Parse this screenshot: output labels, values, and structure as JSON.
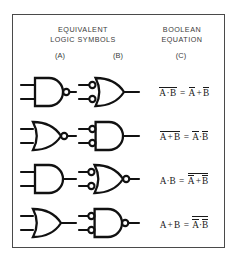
{
  "figure": {
    "border_color": "#4a4a4a",
    "background": "#ffffff",
    "ink_color": "#1a1a1a"
  },
  "header": {
    "left_title": "EQUIVALENT\nLOGIC SYMBOLS",
    "right_title": "BOOLEAN\nEQUATION",
    "columns": [
      {
        "key": "a",
        "label": "(A)"
      },
      {
        "key": "b",
        "label": "(B)"
      },
      {
        "key": "c",
        "label": "(C)"
      }
    ]
  },
  "rows": [
    {
      "index": 1,
      "symbol_a": {
        "shape": "and",
        "name": "nand-gate",
        "input_bubbles": false,
        "output_bubble": true
      },
      "symbol_b": {
        "shape": "or",
        "name": "negative-input-or-gate",
        "input_bubbles": true,
        "output_bubble": false
      },
      "equation": {
        "lhs": {
          "overbar": "full",
          "vars": [
            "A",
            "B"
          ],
          "operator": "·",
          "display": "A·B"
        },
        "rhs": {
          "overbar": "each",
          "vars": [
            "A",
            "B"
          ],
          "operator": "+",
          "display": "A + B"
        },
        "plain": "A·B (bar) = A(bar) + B(bar)"
      }
    },
    {
      "index": 2,
      "symbol_a": {
        "shape": "or",
        "name": "nor-gate",
        "input_bubbles": false,
        "output_bubble": true
      },
      "symbol_b": {
        "shape": "and",
        "name": "negative-input-and-gate",
        "input_bubbles": true,
        "output_bubble": false
      },
      "equation": {
        "lhs": {
          "overbar": "full",
          "vars": [
            "A",
            "B"
          ],
          "operator": "+",
          "display": "A + B"
        },
        "rhs": {
          "overbar": "each",
          "vars": [
            "A",
            "B"
          ],
          "operator": "·",
          "display": "A·B"
        },
        "plain": "A+B (bar) = A(bar)·B(bar)"
      }
    },
    {
      "index": 3,
      "symbol_a": {
        "shape": "and",
        "name": "and-gate",
        "input_bubbles": false,
        "output_bubble": false
      },
      "symbol_b": {
        "shape": "or",
        "name": "negative-input-nor-gate",
        "input_bubbles": true,
        "output_bubble": true
      },
      "equation": {
        "lhs": {
          "overbar": "none",
          "vars": [
            "A",
            "B"
          ],
          "operator": "·",
          "display": "A·B"
        },
        "rhs": {
          "overbar": "full-and-each",
          "vars": [
            "A",
            "B"
          ],
          "operator": "+",
          "display": "A + B"
        },
        "plain": "A·B = A(bar) + B(bar) all barred"
      }
    },
    {
      "index": 4,
      "symbol_a": {
        "shape": "or",
        "name": "or-gate",
        "input_bubbles": false,
        "output_bubble": false
      },
      "symbol_b": {
        "shape": "and",
        "name": "negative-input-nand-gate",
        "input_bubbles": true,
        "output_bubble": true
      },
      "equation": {
        "lhs": {
          "overbar": "none",
          "vars": [
            "A",
            "B"
          ],
          "operator": "+",
          "display": "A + B"
        },
        "rhs": {
          "overbar": "full-and-each",
          "vars": [
            "A",
            "B"
          ],
          "operator": "·",
          "display": "A·B"
        },
        "plain": "A+B = A(bar)·B(bar) all barred"
      }
    }
  ],
  "glyphs": {
    "and_dot": "·",
    "plus": "+",
    "equals": "=",
    "var_a": "A",
    "var_b": "B"
  }
}
